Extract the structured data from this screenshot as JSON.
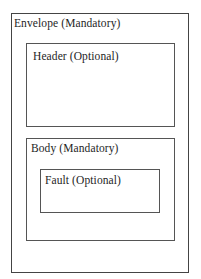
{
  "diagram": {
    "type": "nested-boxes",
    "envelope": {
      "label": "Envelope (Mandatory)"
    },
    "header": {
      "label": "Header (Optional)"
    },
    "body": {
      "label": "Body (Mandatory)"
    },
    "fault": {
      "label": "Fault (Optional)"
    }
  }
}
